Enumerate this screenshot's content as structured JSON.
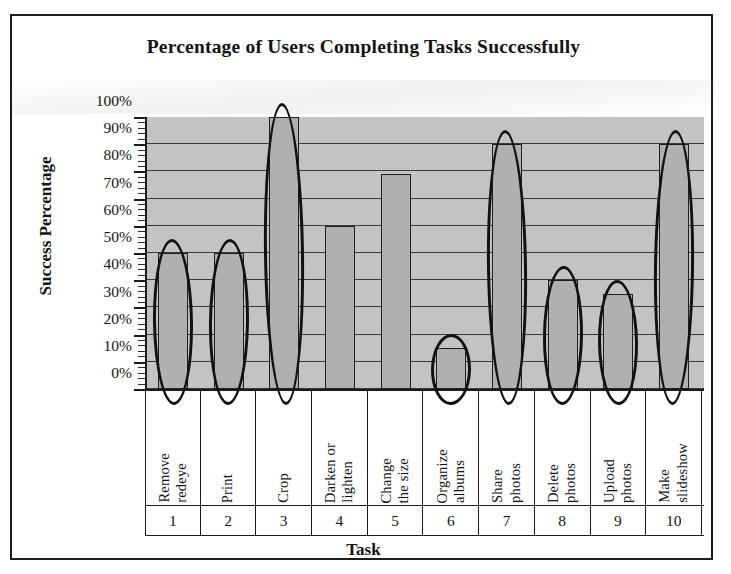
{
  "chart_data": {
    "type": "bar",
    "title": "Percentage of Users Completing Tasks Successfully",
    "xlabel": "Task",
    "ylabel": "Success Percentage",
    "ylim": [
      0,
      100
    ],
    "ytick_labels": [
      "100%",
      "90%",
      "80%",
      "70%",
      "60%",
      "50%",
      "40%",
      "30%",
      "20%",
      "10%",
      "0%"
    ],
    "ytick_values": [
      100,
      90,
      80,
      70,
      60,
      50,
      40,
      30,
      20,
      10,
      0
    ],
    "grid": true,
    "legend": "none",
    "categories": [
      "Remove redeye",
      "Print",
      "Crop",
      "Darken or lighten",
      "Change the size",
      "Organize albums",
      "Share photos",
      "Delete photos",
      "Upload photos",
      "Make slideshow"
    ],
    "category_lines": [
      [
        "Remove",
        "redeye"
      ],
      [
        "Print",
        ""
      ],
      [
        "Crop",
        ""
      ],
      [
        "Darken or",
        "lighten"
      ],
      [
        "Change",
        "the size"
      ],
      [
        "Organize",
        "albums"
      ],
      [
        "Share",
        "photos"
      ],
      [
        "Delete",
        "photos"
      ],
      [
        "Upload",
        "photos"
      ],
      [
        "Make",
        "slideshow"
      ]
    ],
    "category_numbers": [
      "1",
      "2",
      "3",
      "4",
      "5",
      "6",
      "7",
      "8",
      "9",
      "10"
    ],
    "values": [
      50,
      50,
      100,
      60,
      79,
      15,
      90,
      40,
      35,
      90
    ],
    "annotations": {
      "style": "hand-drawn-ellipse",
      "circled_tasks": [
        1,
        2,
        3,
        6,
        7,
        8,
        9,
        10
      ],
      "uncircled_tasks": [
        4,
        5
      ]
    },
    "colors": {
      "bar_fill": "#b0b0b0",
      "bar_stroke": "#1f1f1f",
      "plot_background": "#c3c3c3",
      "gridline": "#3a3a3a",
      "axis": "#1b1b1b",
      "text": "#141414",
      "annotation": "#111111",
      "page_background": "#ffffff"
    }
  }
}
